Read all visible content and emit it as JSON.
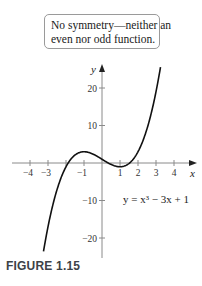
{
  "note": {
    "line1": "No symmetry—neither an",
    "line2": "even nor odd function."
  },
  "caption": "FIGURE 1.15",
  "chart_data": {
    "type": "line",
    "title": "",
    "function": "y = x^3 - 3x + 1",
    "equation_label": "y = x³ − 3x + 1",
    "xlabel": "x",
    "ylabel": "y",
    "x_range": [
      -3.25,
      3.25
    ],
    "xlim": [
      -5,
      5
    ],
    "ylim": [
      -25,
      27
    ],
    "x_ticks": [
      -4,
      -3,
      -2,
      -1,
      0,
      1,
      2,
      3,
      4
    ],
    "x_tick_labels": [
      "−4",
      "−3",
      "",
      "−1",
      "",
      "1",
      "2",
      "3",
      "4"
    ],
    "y_ticks": [
      20,
      10,
      -10,
      -20
    ],
    "y_tick_labels": [
      "20",
      "10",
      "−10",
      "−20"
    ],
    "grid": false,
    "key_points": [
      {
        "x": -1,
        "y": 3,
        "label": "local max"
      },
      {
        "x": 1,
        "y": -1,
        "label": "local min"
      },
      {
        "x": 0,
        "y": 1,
        "label": "y-intercept"
      }
    ],
    "colors": {
      "curve": "#111111",
      "axes": "#8a8a8a"
    }
  }
}
